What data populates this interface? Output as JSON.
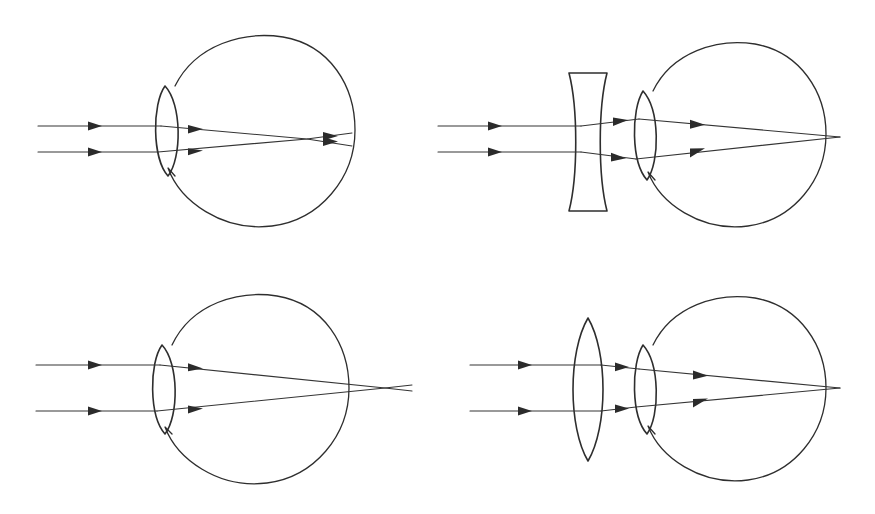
{
  "figure": {
    "background_color": "#ffffff",
    "stroke_color": "#2e2e2e",
    "ray_color": "#343434",
    "width": 875,
    "height": 514,
    "panel_count": 4,
    "panel_layout": "2x2"
  },
  "panels": [
    {
      "id": "top-left",
      "name": "myopia-uncorrected",
      "label": "",
      "condition": "myopia",
      "corrective_lens": "none",
      "ray_count": 2,
      "focus_location": "in front of retina",
      "eye": {
        "cx": 258,
        "cy": 130,
        "r": 97,
        "cornea_cx": 165,
        "cornea_top_y": 86,
        "cornea_bottom_y": 176,
        "cornea_bulge": 16
      },
      "rays": [
        {
          "name": "upper-ray",
          "start_x": 38,
          "y": 126,
          "arrow_x": 96
        },
        {
          "name": "lower-ray",
          "start_x": 38,
          "y": 152,
          "arrow_x": 96
        }
      ],
      "focal_point": {
        "x": 307,
        "y": 139
      },
      "retina_hit": {
        "upper_y": 133,
        "lower_y": 146
      }
    },
    {
      "id": "top-right",
      "name": "myopia-corrected-concave-lens",
      "label": "",
      "condition": "myopia",
      "corrective_lens": "biconcave",
      "ray_count": 2,
      "focus_location": "on retina",
      "eye": {
        "cx": 748,
        "cy": 134,
        "r": 93,
        "cornea_cx": 643,
        "cornea_top_y": 91,
        "cornea_bottom_y": 180,
        "cornea_bulge": 15
      },
      "lens": {
        "name": "concave-lens",
        "type": "biconcave",
        "left_x": 569,
        "right_x": 606,
        "top_y": 73,
        "bottom_y": 211,
        "edge_half_width": 19,
        "waist_half_width": 6
      },
      "rays": [
        {
          "name": "upper-ray",
          "start_x": 438,
          "y": 126,
          "arrow_x": 496
        },
        {
          "name": "lower-ray",
          "start_x": 438,
          "y": 152,
          "arrow_x": 496
        }
      ],
      "focal_point": {
        "x": 840,
        "y": 137
      }
    },
    {
      "id": "bottom-left",
      "name": "hyperopia-uncorrected",
      "label": "",
      "condition": "hyperopia",
      "corrective_lens": "none",
      "ray_count": 2,
      "focus_location": "behind retina",
      "eye": {
        "cx": 253,
        "cy": 388,
        "r": 96,
        "cornea_cx": 162,
        "cornea_top_y": 345,
        "cornea_bottom_y": 434,
        "cornea_bulge": 15
      },
      "rays": [
        {
          "name": "upper-ray",
          "start_x": 36,
          "y": 365,
          "arrow_x": 96
        },
        {
          "name": "lower-ray",
          "start_x": 36,
          "y": 411,
          "arrow_x": 96
        }
      ],
      "focal_point": {
        "x": 385,
        "y": 388
      },
      "rays_exit_x": 412
    },
    {
      "id": "bottom-right",
      "name": "hyperopia-corrected-convex-lens",
      "label": "",
      "condition": "hyperopia",
      "corrective_lens": "biconvex",
      "ray_count": 2,
      "focus_location": "on retina",
      "eye": {
        "cx": 748,
        "cy": 388,
        "r": 93,
        "cornea_cx": 643,
        "cornea_top_y": 345,
        "cornea_bottom_y": 434,
        "cornea_bulge": 15
      },
      "lens": {
        "name": "convex-lens",
        "type": "biconvex",
        "cx": 588,
        "top_y": 318,
        "bottom_y": 461,
        "half_width": 21
      },
      "rays": [
        {
          "name": "upper-ray",
          "start_x": 470,
          "y": 365,
          "arrow_x": 530
        },
        {
          "name": "lower-ray",
          "start_x": 470,
          "y": 411,
          "arrow_x": 530
        }
      ],
      "focal_point": {
        "x": 840,
        "y": 388
      }
    }
  ]
}
